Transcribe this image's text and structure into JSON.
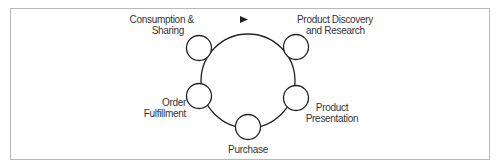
{
  "diagram": {
    "type": "cycle",
    "direction": "clockwise",
    "nodes": [
      {
        "id": "consumption",
        "label_line1": "Consumption &",
        "label_line2": "Sharing"
      },
      {
        "id": "discovery",
        "label_line1": "Product Discovery",
        "label_line2": "and Research"
      },
      {
        "id": "presentation",
        "label_line1": "Product",
        "label_line2": "Presentation"
      },
      {
        "id": "purchase",
        "label_line1": "Purchase",
        "label_line2": ""
      },
      {
        "id": "fulfillment",
        "label_line1": "Order",
        "label_line2": "Fulfillment"
      }
    ],
    "edges": [
      {
        "from": "consumption",
        "to": "discovery",
        "arrow": true
      },
      {
        "from": "discovery",
        "to": "presentation",
        "arrow": false
      },
      {
        "from": "presentation",
        "to": "purchase",
        "arrow": false
      },
      {
        "from": "purchase",
        "to": "fulfillment",
        "arrow": false
      },
      {
        "from": "fulfillment",
        "to": "consumption",
        "arrow": false
      }
    ],
    "colors": {
      "stroke": "#222222",
      "frame": "#b8b8b8",
      "text": "#333333"
    }
  }
}
